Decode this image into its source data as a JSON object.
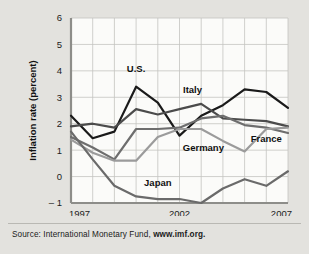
{
  "figure": {
    "source_prefix": "Source: International Monetary Fund,",
    "source_link": "www.imf.org."
  },
  "chart_data": {
    "type": "line",
    "title": "",
    "xlabel": "",
    "ylabel": "Inflation rate (percent)",
    "xlim": [
      1997,
      2007
    ],
    "ylim": [
      -1,
      6
    ],
    "yticks": [
      -1,
      0,
      1,
      2,
      3,
      4,
      5,
      6
    ],
    "ytick_labels": [
      "– 1",
      "0",
      "1",
      "2",
      "3",
      "4",
      "5",
      "6"
    ],
    "xticks": [
      1997,
      2002,
      2007
    ],
    "xtick_labels": [
      "1997",
      "2002",
      "2007"
    ],
    "grid": true,
    "legend_position": "inline-labels",
    "x": [
      1997,
      1998,
      1999,
      2000,
      2001,
      2002,
      2003,
      2004,
      2005,
      2006,
      2007
    ],
    "series": [
      {
        "name": "U.S.",
        "color": "#1a1a1a",
        "label": "U.S.",
        "label_x": 2000.0,
        "label_y": 3.95,
        "values": [
          2.3,
          1.45,
          1.7,
          3.4,
          2.8,
          1.55,
          2.3,
          2.7,
          3.3,
          3.2,
          2.6
        ]
      },
      {
        "name": "Italy",
        "color": "#4b4b4b",
        "label": "Italy",
        "label_x": 2002.6,
        "label_y": 3.15,
        "values": [
          1.9,
          2.0,
          1.85,
          2.55,
          2.35,
          2.55,
          2.75,
          2.2,
          2.15,
          2.1,
          1.9
        ]
      },
      {
        "name": "France",
        "color": "#6e6e6e",
        "label": "France",
        "label_x": 2006.0,
        "label_y": 1.3,
        "values": [
          1.5,
          1.1,
          0.65,
          1.8,
          1.8,
          1.85,
          2.2,
          2.3,
          1.95,
          1.85,
          1.65
        ]
      },
      {
        "name": "Germany",
        "color": "#9b9b9b",
        "label": "Germany",
        "label_x": 2003.1,
        "label_y": 0.95,
        "values": [
          1.4,
          0.9,
          0.6,
          0.6,
          1.5,
          1.8,
          1.8,
          1.35,
          0.95,
          1.8,
          1.85
        ]
      },
      {
        "name": "Japan",
        "color": "#6a6a6a",
        "label": "Japan",
        "label_x": 2001.0,
        "label_y": -0.35,
        "values": [
          1.7,
          0.65,
          -0.35,
          -0.75,
          -0.85,
          -0.85,
          -1.0,
          -0.45,
          -0.1,
          -0.35,
          0.2
        ]
      }
    ]
  }
}
